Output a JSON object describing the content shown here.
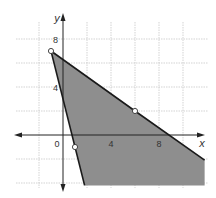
{
  "chart_data": {
    "type": "line",
    "title": "",
    "xlabel": "x",
    "ylabel": "y",
    "xlim": [
      -4,
      12
    ],
    "ylim": [
      -4.2,
      10
    ],
    "grid": true,
    "grid_step": 2,
    "x_tick_labels": [
      {
        "value": 0,
        "label": "0"
      },
      {
        "value": 4,
        "label": "4"
      },
      {
        "value": 8,
        "label": "8"
      }
    ],
    "y_tick_labels": [
      {
        "value": 4,
        "label": "4"
      },
      {
        "value": 8,
        "label": "8"
      }
    ],
    "series": [
      {
        "name": "boundary line 1",
        "equation": "y = -4x + 3",
        "points": [
          [
            -1,
            7
          ],
          [
            1,
            -1
          ],
          [
            1.8,
            -4.2
          ]
        ],
        "style": "solid"
      },
      {
        "name": "boundary line 2",
        "equation": "y = -5/7 x + 44/7",
        "points": [
          [
            -1,
            7
          ],
          [
            6,
            2
          ],
          [
            11.8,
            -2.1
          ]
        ],
        "style": "solid"
      }
    ],
    "open_points": [
      [
        -1,
        7
      ],
      [
        1,
        -1
      ],
      [
        6,
        2
      ]
    ],
    "shaded_region": {
      "description": "region below line 2 and right of line 1",
      "vertices": [
        [
          -1,
          7
        ],
        [
          11.8,
          -2.1
        ],
        [
          11.8,
          -4.2
        ],
        [
          1.8,
          -4.2
        ]
      ]
    },
    "colors": {
      "shade": "#8e8e8e",
      "line": "#1a1a1a",
      "grid": "#c8c8c8",
      "axis": "#222222"
    }
  }
}
